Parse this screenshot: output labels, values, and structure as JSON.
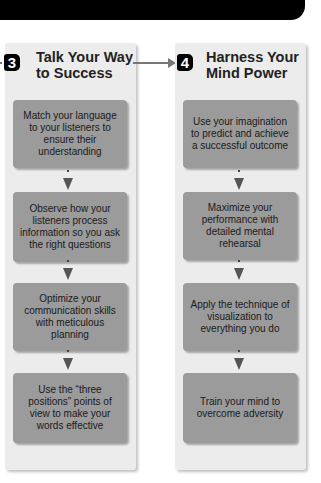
{
  "header_bar": {
    "color": "#000000"
  },
  "columns": [
    {
      "step_number": "3",
      "title_line1": "Talk Your Way",
      "title_line2": "to Success",
      "steps": [
        "Match your language to your listeners to ensure their understanding",
        "Observe how your listeners process information so you ask the right questions",
        "Optimize your communication skills with meticulous planning",
        "Use the “three positions” points of view to make your words effective"
      ]
    },
    {
      "step_number": "4",
      "title_line1": "Harness Your",
      "title_line2": "Mind Power",
      "steps": [
        "Use your imagination to predict and achieve a successful outcome",
        "Maximize your performance with detailed mental rehearsal",
        "Apply the technique of visualization to everything you do",
        "Train your mind to overcome adversity"
      ]
    }
  ],
  "colors": {
    "panel": "#ececec",
    "box": "#9b9b9b",
    "arrow": "#777777",
    "badge": "#000000"
  }
}
